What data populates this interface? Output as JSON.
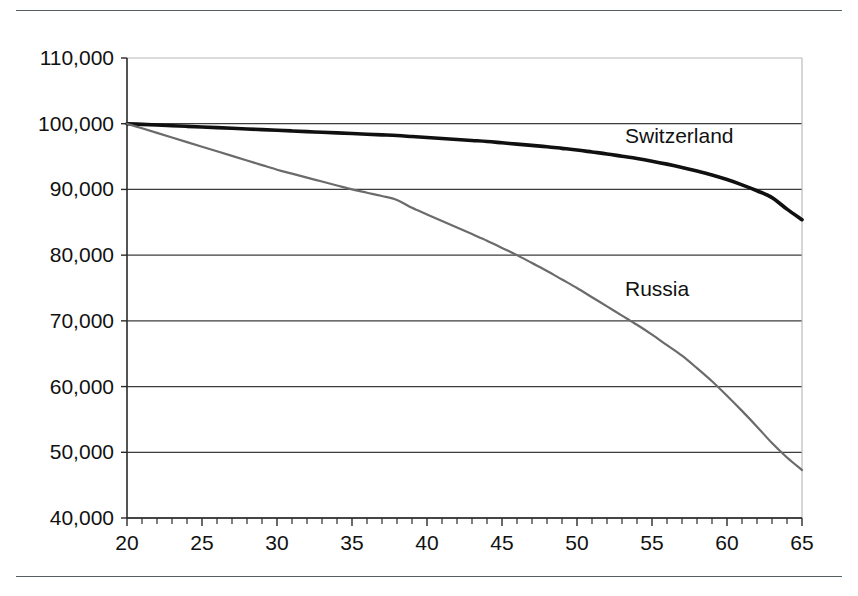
{
  "figure": {
    "background_color": "#ffffff",
    "rule_color": "#555f63",
    "has_top_rule": true,
    "has_bottom_rule": true
  },
  "chart_data": {
    "type": "line",
    "title": "",
    "subtitle": "",
    "xlabel": "",
    "ylabel": "",
    "xlim": [
      20,
      65
    ],
    "ylim": [
      40000,
      110000
    ],
    "x_ticks": [
      20,
      25,
      30,
      35,
      40,
      45,
      50,
      55,
      60,
      65
    ],
    "x_tick_labels": [
      "20",
      "25",
      "30",
      "35",
      "40",
      "45",
      "50",
      "55",
      "60",
      "65"
    ],
    "x_minor_tick_step": 1,
    "y_ticks": [
      40000,
      50000,
      60000,
      70000,
      80000,
      90000,
      100000,
      110000
    ],
    "y_tick_labels": [
      "40,000",
      "50,000",
      "60,000",
      "70,000",
      "80,000",
      "90,000",
      "100,000",
      "110,000"
    ],
    "grid": "horizontal",
    "legend_position": "inline-annotations",
    "x": [
      20,
      21,
      22,
      23,
      24,
      25,
      26,
      27,
      28,
      29,
      30,
      31,
      32,
      33,
      34,
      35,
      36,
      37,
      38,
      39,
      40,
      41,
      42,
      43,
      44,
      45,
      46,
      47,
      48,
      49,
      50,
      51,
      52,
      53,
      54,
      55,
      56,
      57,
      58,
      59,
      60,
      61,
      62,
      63,
      64,
      65
    ],
    "series": [
      {
        "name": "Switzerland",
        "color": "#101010",
        "line_width": 3.6,
        "label_x": 53.2,
        "label_y": 97000,
        "values": [
          100000,
          99900,
          99800,
          99700,
          99600,
          99500,
          99400,
          99300,
          99200,
          99100,
          99000,
          98900,
          98800,
          98700,
          98600,
          98500,
          98400,
          98300,
          98200,
          98050,
          97900,
          97750,
          97600,
          97450,
          97300,
          97100,
          96900,
          96700,
          96500,
          96250,
          96000,
          95700,
          95400,
          95050,
          94700,
          94300,
          93850,
          93350,
          92800,
          92200,
          91500,
          90700,
          89800,
          88750,
          87000,
          85400
        ]
      },
      {
        "name": "Russia",
        "color": "#6b6b6b",
        "line_width": 2.2,
        "label_x": 53.2,
        "label_y": 73800,
        "values": [
          100000,
          99300,
          98600,
          97900,
          97200,
          96500,
          95800,
          95100,
          94400,
          93700,
          93000,
          92400,
          91800,
          91200,
          90600,
          90000,
          89500,
          89000,
          88400,
          87200,
          86200,
          85200,
          84200,
          83200,
          82200,
          81100,
          80000,
          78800,
          77600,
          76300,
          75000,
          73600,
          72200,
          70800,
          69400,
          67900,
          66300,
          64700,
          62800,
          60800,
          58600,
          56300,
          53900,
          51400,
          49200,
          47300
        ]
      }
    ],
    "annotations": [
      {
        "text": "Switzerland",
        "x": 53.2,
        "y": 97000
      },
      {
        "text": "Russia",
        "x": 53.2,
        "y": 73800
      }
    ]
  }
}
